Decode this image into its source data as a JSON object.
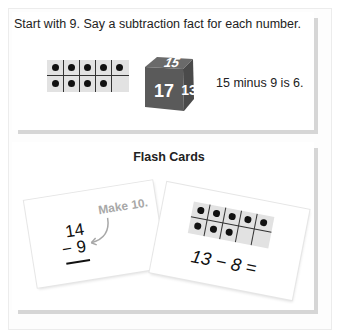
{
  "section1": {
    "instruction": "Start with 9. Say a subtraction fact for each number.",
    "ten_frame": {
      "filled": 9,
      "total": 10,
      "top_row": [
        1,
        1,
        1,
        1,
        1
      ],
      "bottom_row": [
        1,
        1,
        1,
        1,
        0
      ]
    },
    "die": {
      "faces": [
        "15",
        "17",
        "13"
      ],
      "color": "#5a5a5a"
    },
    "example": "15 minus 9 is 6."
  },
  "section2": {
    "title": "Flash Cards",
    "card1": {
      "top": "14",
      "bottom": "− 9",
      "hint": "Make 10.",
      "hint_color": "#a8a8a8"
    },
    "card2": {
      "ten_frame": {
        "filled": 8,
        "top_row": [
          1,
          1,
          1,
          1,
          1
        ],
        "bottom_row": [
          1,
          1,
          1,
          0,
          0
        ]
      },
      "equation": "13 − 8 ="
    }
  }
}
